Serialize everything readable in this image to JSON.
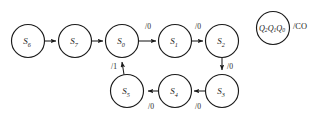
{
  "diagram": {
    "type": "finite-state-machine",
    "title": "",
    "background_color": "#ffffff",
    "stroke_color": "#1a1a1a",
    "nodes": [
      {
        "id": "S6",
        "label": "S",
        "sub": "6",
        "cx": 28,
        "cy": 41,
        "r": 16.5
      },
      {
        "id": "S7",
        "label": "S",
        "sub": "7",
        "cx": 75,
        "cy": 41,
        "r": 16.5
      },
      {
        "id": "S0",
        "label": "S",
        "sub": "0",
        "cx": 122,
        "cy": 41,
        "r": 16.5
      },
      {
        "id": "S1",
        "label": "S",
        "sub": "1",
        "cx": 175,
        "cy": 41,
        "r": 16.5
      },
      {
        "id": "S2",
        "label": "S",
        "sub": "2",
        "cx": 222,
        "cy": 41,
        "r": 16.5
      },
      {
        "id": "S3",
        "label": "S",
        "sub": "3",
        "cx": 222,
        "cy": 91,
        "r": 16.5
      },
      {
        "id": "S4",
        "label": "S",
        "sub": "4",
        "cx": 175,
        "cy": 91,
        "r": 16.5
      },
      {
        "id": "S5",
        "label": "S",
        "sub": "5",
        "cx": 127,
        "cy": 91,
        "r": 16.5
      }
    ],
    "edges": [
      {
        "id": "e-S6-S7",
        "from": "S6",
        "to": "S7",
        "label": "",
        "label_x": 0,
        "label_y": 0
      },
      {
        "id": "e-S7-S0",
        "from": "S7",
        "to": "S0",
        "label": "",
        "label_x": 0,
        "label_y": 0
      },
      {
        "id": "e-S0-S1",
        "from": "S0",
        "to": "S1",
        "label": "/0",
        "label_x": 148,
        "label_y": 26
      },
      {
        "id": "e-S1-S2",
        "from": "S1",
        "to": "S2",
        "label": "/0",
        "label_x": 198,
        "label_y": 26
      },
      {
        "id": "e-S2-S3",
        "from": "S2",
        "to": "S3",
        "label": "/0",
        "label_x": 230,
        "label_y": 66
      },
      {
        "id": "e-S3-S4",
        "from": "S3",
        "to": "S4",
        "label": "/0",
        "label_x": 198,
        "label_y": 106
      },
      {
        "id": "e-S4-S5",
        "from": "S4",
        "to": "S5",
        "label": "/0",
        "label_x": 151,
        "label_y": 106
      },
      {
        "id": "e-S5-S0",
        "from": "S5",
        "to": "S0",
        "label": "/1",
        "label_x": 114,
        "label_y": 66
      }
    ],
    "legend": {
      "id": "state-encoding-key",
      "circle": {
        "cx": 273,
        "cy": 28,
        "r": 16.5
      },
      "state_vars": "Q",
      "state_var_subs": [
        "2",
        "1",
        "0"
      ],
      "state_vars_text": "Q2Q1Q0",
      "output_label": "/CO",
      "output_x": 293,
      "output_y": 26
    }
  }
}
